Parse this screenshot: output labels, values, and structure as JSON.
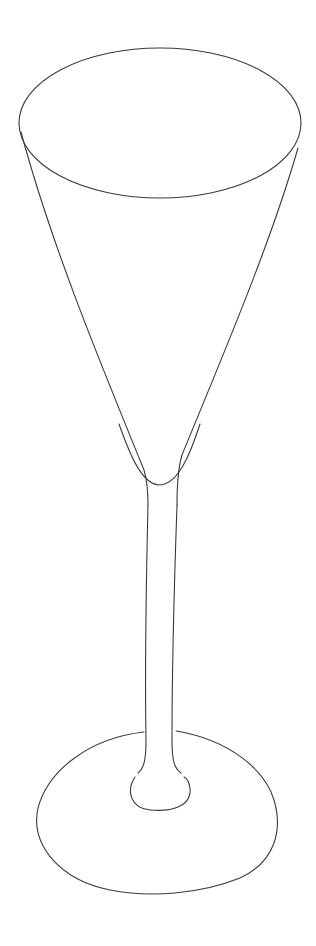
{
  "image": {
    "subject": "champagne flute line drawing",
    "medium": "pencil sketch",
    "background_color": "#ffffff",
    "stroke_color": "#3a3a3a",
    "parts": [
      {
        "name": "rim",
        "shape": "ellipse",
        "cx": 160,
        "cy": 123,
        "rx": 141,
        "ry": 75
      },
      {
        "name": "bowl",
        "shape": "tapered cone"
      },
      {
        "name": "liquid-line",
        "shape": "u-curve"
      },
      {
        "name": "stem",
        "shape": "long narrow tube"
      },
      {
        "name": "stem-knot",
        "shape": "small ellipse"
      },
      {
        "name": "foot",
        "shape": "ellipse",
        "cx": 158,
        "cy": 810,
        "rx": 120,
        "ry": 82
      }
    ]
  }
}
